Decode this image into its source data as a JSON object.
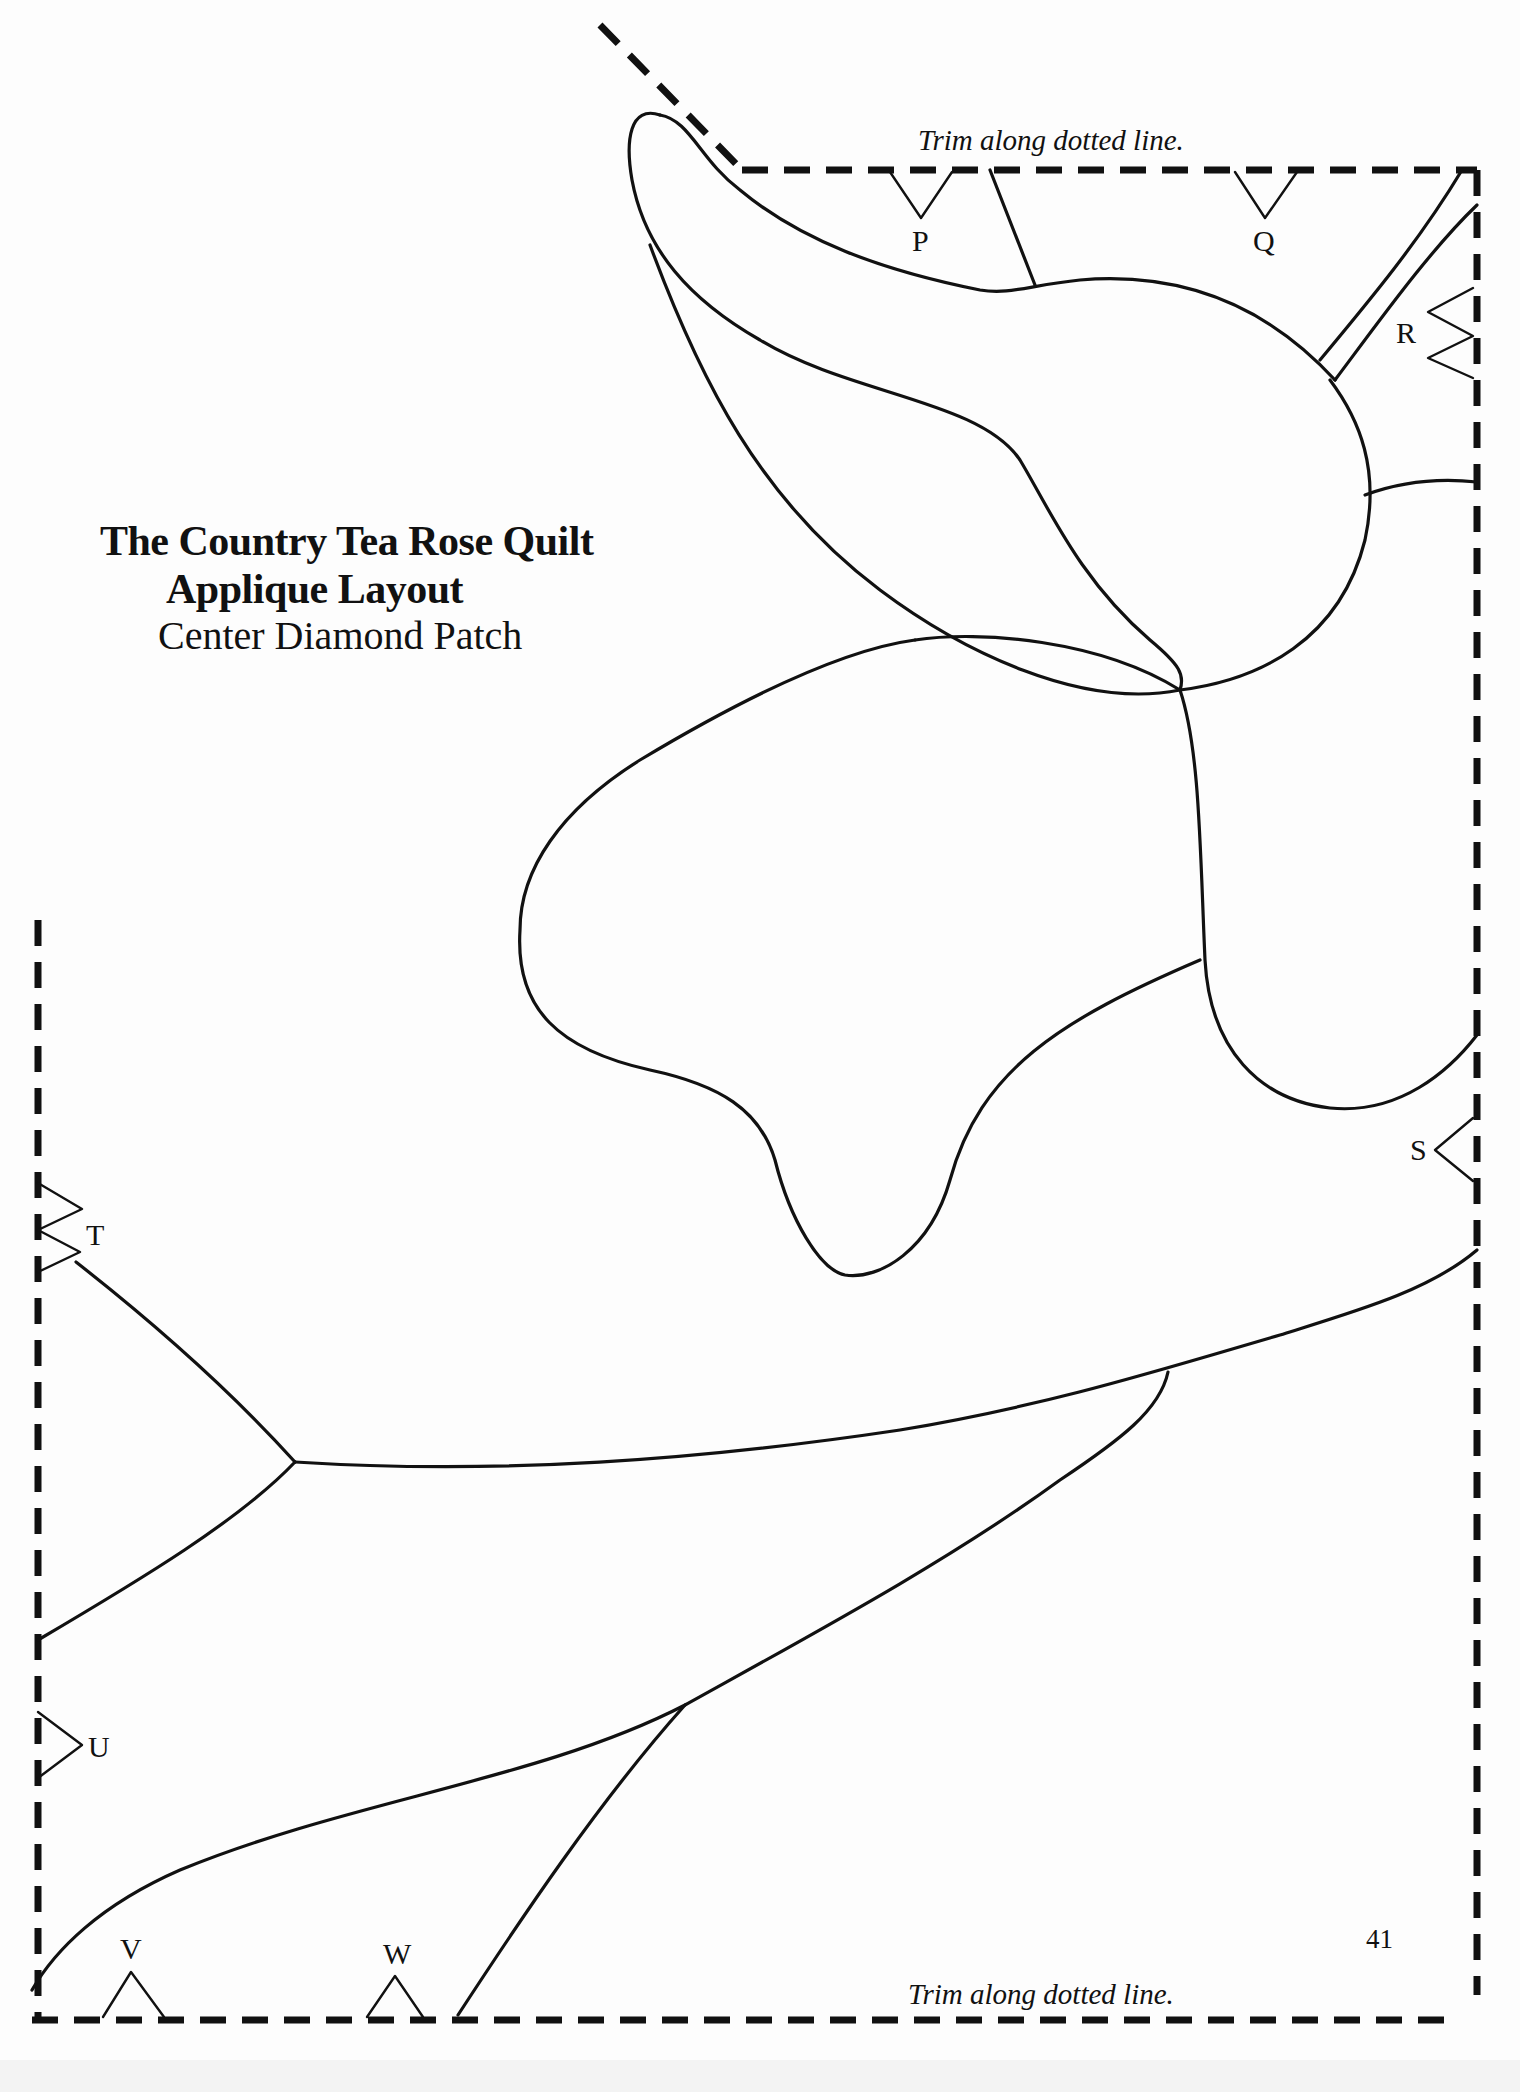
{
  "title": {
    "line1": "The Country Tea Rose Quilt",
    "line2": "Applique Layout",
    "line3": "Center Diamond Patch"
  },
  "trim_labels": {
    "top": "Trim along dotted line.",
    "bottom": "Trim along dotted line."
  },
  "page_number": "41",
  "registration_marks": [
    {
      "label": "P",
      "edge": "top"
    },
    {
      "label": "Q",
      "edge": "top"
    },
    {
      "label": "R",
      "edge": "right"
    },
    {
      "label": "S",
      "edge": "right"
    },
    {
      "label": "T",
      "edge": "left"
    },
    {
      "label": "U",
      "edge": "left"
    },
    {
      "label": "V",
      "edge": "bottom"
    },
    {
      "label": "W",
      "edge": "bottom"
    }
  ],
  "colors": {
    "ink": "#111111",
    "paper": "#fdfdfd"
  }
}
